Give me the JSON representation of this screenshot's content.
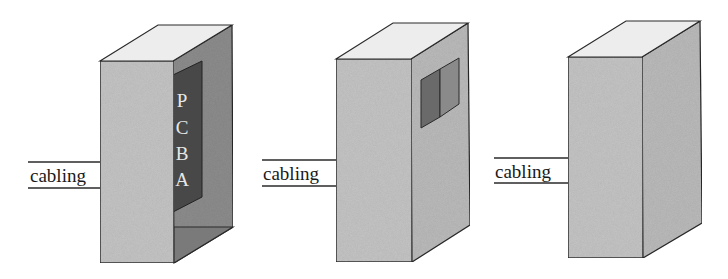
{
  "diagram": {
    "type": "enclosure-progression",
    "panels": [
      {
        "id": "open-enclosure",
        "cable_label": "cabling",
        "pcba_letters": [
          "P",
          "C",
          "B",
          "A"
        ],
        "description": "Open enclosure with exposed PCBA"
      },
      {
        "id": "enclosure-with-window",
        "cable_label": "cabling",
        "description": "Closed enclosure with small window on side"
      },
      {
        "id": "closed-enclosure",
        "cable_label": "cabling",
        "description": "Fully closed enclosure"
      }
    ],
    "colors": {
      "front_face": "#c6c6c6",
      "side_face": "#bcbcbc",
      "top_face": "#ededed",
      "interior_side": "#8e8e8e",
      "interior_bottom": "#7a7a7a",
      "pcba": "#484848",
      "window_left": "#6a6a6a",
      "window_right": "#8a8a8a",
      "stroke": "#2a2a2a"
    }
  }
}
